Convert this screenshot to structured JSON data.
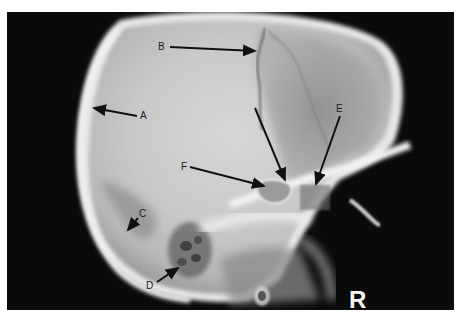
{
  "figure": {
    "marker": "R",
    "labels": [
      {
        "id": "A",
        "text": "A"
      },
      {
        "id": "B",
        "text": "B"
      },
      {
        "id": "C",
        "text": "C"
      },
      {
        "id": "D",
        "text": "D"
      },
      {
        "id": "E",
        "text": "E"
      },
      {
        "id": "F",
        "text": "F"
      }
    ]
  }
}
